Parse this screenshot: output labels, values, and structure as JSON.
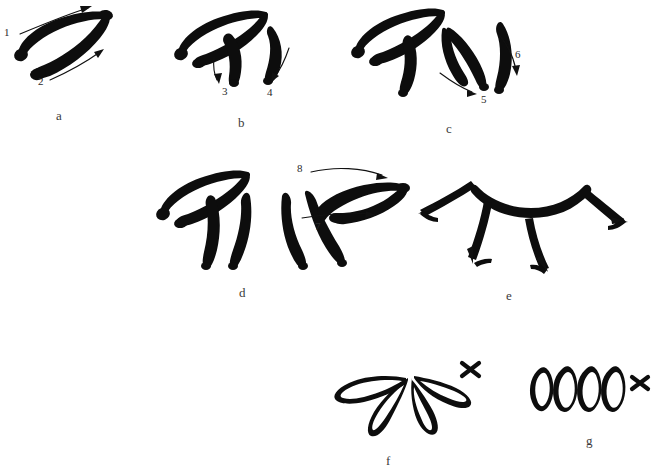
{
  "figure": {
    "background_color": "#ffffff",
    "ink_color": "#0d0d0d",
    "label_color": "#3a3a3a",
    "title": "",
    "caption": ""
  },
  "panels": [
    {
      "id": "a",
      "label": "a",
      "x": 56,
      "y": 109,
      "description": "two opposing curved brush strokes forming an open lens/ellipse shape"
    },
    {
      "id": "b",
      "label": "b",
      "x": 238,
      "y": 116,
      "description": "four strokes: outer lens plus two inner downward curves"
    },
    {
      "id": "c",
      "label": "c",
      "x": 446,
      "y": 122,
      "description": "six strokes fanning outward"
    },
    {
      "id": "d",
      "label": "d",
      "x": 239,
      "y": 286,
      "description": "eight strokes forming a full symmetric fan of lens shapes"
    },
    {
      "id": "e",
      "label": "e",
      "x": 506,
      "y": 289,
      "description": "schematic arc with four diverging arrows"
    },
    {
      "id": "f",
      "label": "f",
      "x": 386,
      "y": 454,
      "description": "outline petal cluster with cross mark"
    },
    {
      "id": "g",
      "label": "g",
      "x": 586,
      "y": 434,
      "description": "four outlined ovals in a row with cross mark"
    }
  ],
  "stroke_numbers": [
    {
      "id": "1",
      "label": "1",
      "x": 4,
      "y": 27,
      "panel": "a"
    },
    {
      "id": "2",
      "label": "2",
      "x": 38,
      "y": 76,
      "panel": "a"
    },
    {
      "id": "3",
      "label": "3",
      "x": 222,
      "y": 86,
      "panel": "b"
    },
    {
      "id": "4",
      "label": "4",
      "x": 267,
      "y": 87,
      "panel": "b"
    },
    {
      "id": "5",
      "label": "5",
      "x": 481,
      "y": 94,
      "panel": "c"
    },
    {
      "id": "6",
      "label": "6",
      "x": 515,
      "y": 49,
      "panel": "c"
    },
    {
      "id": "7",
      "label": "7",
      "x": 315,
      "y": 221,
      "panel": "d"
    },
    {
      "id": "8",
      "label": "8",
      "x": 297,
      "y": 163,
      "panel": "d"
    }
  ],
  "marks": [
    {
      "id": "cross-f",
      "label": "x",
      "panel": "f",
      "x": 470,
      "y": 369
    },
    {
      "id": "cross-g",
      "label": "x",
      "panel": "g",
      "x": 639,
      "y": 383
    }
  ]
}
